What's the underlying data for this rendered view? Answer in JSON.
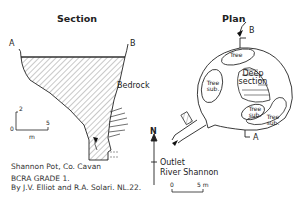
{
  "section": {
    "title": "Section",
    "label_a": "A",
    "label_b": "B",
    "bedrock_label": "Bedrock",
    "scale": {
      "v_tick": "2",
      "origin": "0",
      "h_tick": "5",
      "unit": "m"
    }
  },
  "plan": {
    "title": "Plan",
    "label_a": "A",
    "label_b": "B",
    "areas": [
      "Tree",
      "Tree sub.",
      "Deep section",
      "Tree sub.",
      "Tree sub."
    ],
    "north": "N",
    "outlet_label_1": "Outlet",
    "outlet_label_2": "River Shannon",
    "scale": {
      "start": "0",
      "end": "5 m"
    }
  },
  "caption": {
    "site": "Shannon Pot, Co. Cavan",
    "grade": "BCRA GRADE 1.",
    "credit": "By J.V. Elliot and R.A. Solari. NL.22."
  }
}
